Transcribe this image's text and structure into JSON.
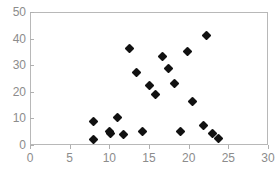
{
  "chart_data": {
    "type": "scatter",
    "title": "",
    "subtitle": "",
    "xlabel": "",
    "ylabel": "",
    "xlim": [
      0,
      30
    ],
    "ylim": [
      0,
      50
    ],
    "xticks": [
      0,
      5,
      10,
      15,
      20,
      25,
      30
    ],
    "yticks": [
      0,
      10,
      20,
      30,
      40,
      50
    ],
    "xtick_labels": [
      "0",
      "5",
      "10",
      "15",
      "20",
      "25",
      "30"
    ],
    "ytick_labels": [
      "0",
      "10",
      "20",
      "30",
      "40",
      "50"
    ],
    "grid": false,
    "legend": null,
    "annotations": [],
    "marker_style": "filled-diamond",
    "marker_color": "#111111",
    "frame_color": "#b8b8b8",
    "tick_label_color": "#8c8c8c",
    "background_color": "#ffffff",
    "series": [
      {
        "name": "series-1",
        "points": [
          {
            "x": 8.0,
            "y": 9.0
          },
          {
            "x": 8.0,
            "y": 2.2
          },
          {
            "x": 10.0,
            "y": 5.0
          },
          {
            "x": 10.1,
            "y": 4.3
          },
          {
            "x": 11.0,
            "y": 10.2
          },
          {
            "x": 11.8,
            "y": 4.1
          },
          {
            "x": 12.6,
            "y": 36.1
          },
          {
            "x": 13.4,
            "y": 27.2
          },
          {
            "x": 14.2,
            "y": 5.2
          },
          {
            "x": 15.0,
            "y": 22.3
          },
          {
            "x": 15.8,
            "y": 19.1
          },
          {
            "x": 16.7,
            "y": 33.1
          },
          {
            "x": 17.4,
            "y": 28.8
          },
          {
            "x": 18.2,
            "y": 23.2
          },
          {
            "x": 19.0,
            "y": 5.2
          },
          {
            "x": 19.8,
            "y": 35.1
          },
          {
            "x": 20.5,
            "y": 16.2
          },
          {
            "x": 21.9,
            "y": 7.2
          },
          {
            "x": 22.2,
            "y": 41.3
          },
          {
            "x": 23.0,
            "y": 4.4
          },
          {
            "x": 23.8,
            "y": 2.3
          }
        ]
      }
    ]
  }
}
